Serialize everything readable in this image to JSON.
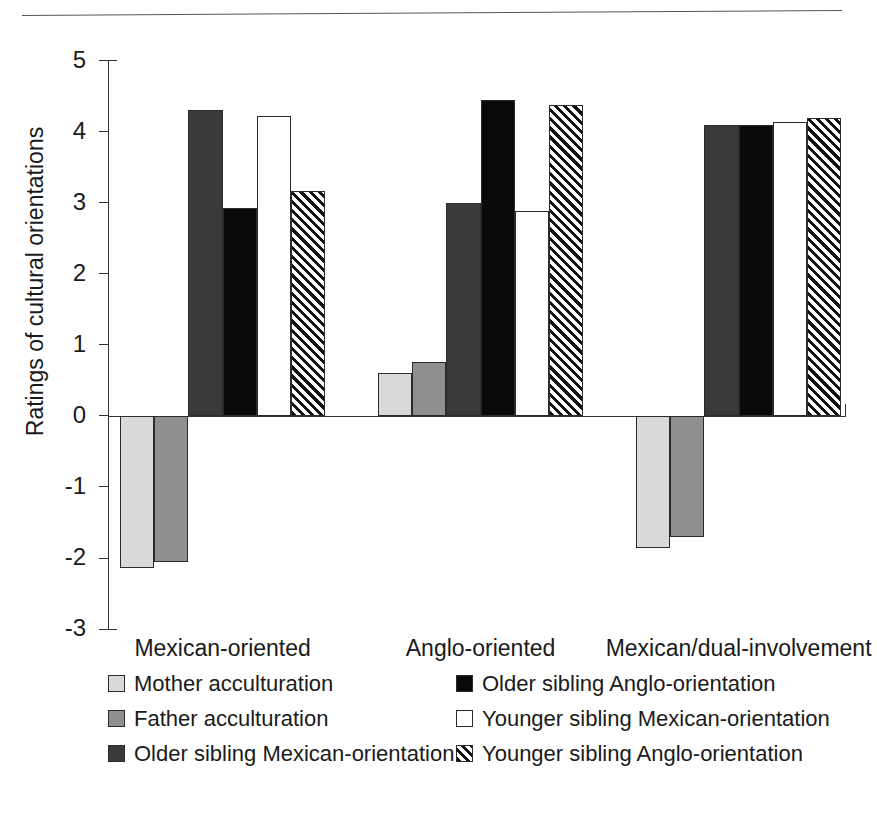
{
  "chart_data": {
    "type": "bar",
    "title": "",
    "xlabel": "",
    "ylabel": "Ratings of cultural orientations",
    "categories": [
      "Mexican-oriented",
      "Anglo-oriented",
      "Mexican/dual-involvement"
    ],
    "ylim": [
      -3,
      5
    ],
    "yticks": [
      5,
      4,
      3,
      2,
      1,
      0,
      -1,
      -2,
      -3
    ],
    "ytick_labels": [
      "5",
      "4",
      "3",
      "2",
      "1",
      "0",
      "-1",
      "-2",
      "-3"
    ],
    "grid": false,
    "legend_position": "bottom",
    "series": [
      {
        "name": "Mother acculturation",
        "swatch": "light-gray",
        "color": "#d9d9d9",
        "values": [
          -2.14,
          0.61,
          -1.85
        ]
      },
      {
        "name": "Father acculturation",
        "swatch": "medium-gray",
        "color": "#8f8f8f",
        "values": [
          -2.05,
          0.76,
          -1.7
        ]
      },
      {
        "name": "Older sibling Mexican-orientation",
        "swatch": "dark-gray",
        "color": "#3a3a3a",
        "values": [
          4.31,
          2.99,
          4.09
        ]
      },
      {
        "name": "Older sibling Anglo-orientation",
        "swatch": "black",
        "color": "#090909",
        "values": [
          2.93,
          4.45,
          4.09
        ]
      },
      {
        "name": "Younger sibling Mexican-orientation",
        "swatch": "white",
        "color": "#ffffff",
        "values": [
          4.22,
          2.88,
          4.14
        ]
      },
      {
        "name": "Younger sibling Anglo-orientation",
        "swatch": "diagonal-hatch",
        "color": "#ffffff",
        "values": [
          3.17,
          4.37,
          4.19
        ]
      }
    ]
  },
  "legend": {
    "left_column": [
      "Mother acculturation",
      "Father acculturation",
      "Older sibling Mexican-orientation"
    ],
    "right_column": [
      "Older sibling Anglo-orientation",
      "Younger sibling Mexican-orientation",
      "Younger sibling Anglo-orientation"
    ]
  }
}
